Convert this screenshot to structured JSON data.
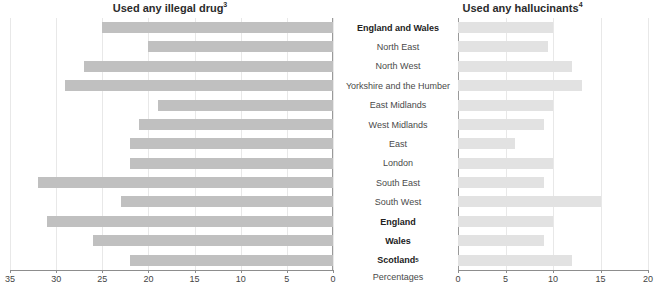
{
  "charts": {
    "left": {
      "title": "Used any illegal drug",
      "title_superscript": "3"
    },
    "right": {
      "title": "Used any hallucinants",
      "title_superscript": "4"
    },
    "axis_caption": "Percentages"
  },
  "categories": [
    {
      "label": "England and Wales",
      "bold": true,
      "superscript": ""
    },
    {
      "label": "North East",
      "bold": false,
      "superscript": ""
    },
    {
      "label": "North West",
      "bold": false,
      "superscript": ""
    },
    {
      "label": "Yorkshire and the Humber",
      "bold": false,
      "superscript": ""
    },
    {
      "label": "East Midlands",
      "bold": false,
      "superscript": ""
    },
    {
      "label": "West Midlands",
      "bold": false,
      "superscript": ""
    },
    {
      "label": "East",
      "bold": false,
      "superscript": ""
    },
    {
      "label": "London",
      "bold": false,
      "superscript": ""
    },
    {
      "label": "South East",
      "bold": false,
      "superscript": ""
    },
    {
      "label": "South West",
      "bold": false,
      "superscript": ""
    },
    {
      "label": "England",
      "bold": true,
      "superscript": ""
    },
    {
      "label": "Wales",
      "bold": true,
      "superscript": ""
    },
    {
      "label": "Scotland",
      "bold": true,
      "superscript": "5"
    }
  ],
  "chart_data": [
    {
      "type": "bar",
      "orientation": "horizontal-reversed",
      "title": "Used any illegal drug",
      "xlabel": "Percentages",
      "ylabel": "",
      "xlim": [
        35,
        0
      ],
      "ticks": [
        35,
        30,
        25,
        20,
        15,
        10,
        5,
        0
      ],
      "grid": true,
      "legend": "none",
      "bar_color": "#c0c0c0",
      "categories": [
        "England and Wales",
        "North East",
        "North West",
        "Yorkshire and the Humber",
        "East Midlands",
        "West Midlands",
        "East",
        "London",
        "South East",
        "South West",
        "England",
        "Wales",
        "Scotland"
      ],
      "values": [
        25,
        20,
        27,
        29,
        19,
        21,
        22,
        22,
        32,
        23,
        31,
        26,
        22
      ]
    },
    {
      "type": "bar",
      "orientation": "horizontal",
      "title": "Used any hallucinants",
      "xlabel": "Percentages",
      "ylabel": "",
      "xlim": [
        0,
        20
      ],
      "ticks": [
        0,
        5,
        10,
        15,
        20
      ],
      "grid": true,
      "legend": "none",
      "bar_color": "#e2e2e2",
      "categories": [
        "England and Wales",
        "North East",
        "North West",
        "Yorkshire and the Humber",
        "East Midlands",
        "West Midlands",
        "East",
        "London",
        "South East",
        "South West",
        "England",
        "Wales",
        "Scotland"
      ],
      "values": [
        10,
        9.5,
        12,
        13,
        10,
        9,
        6,
        10,
        9,
        15,
        10,
        9,
        12
      ]
    }
  ]
}
